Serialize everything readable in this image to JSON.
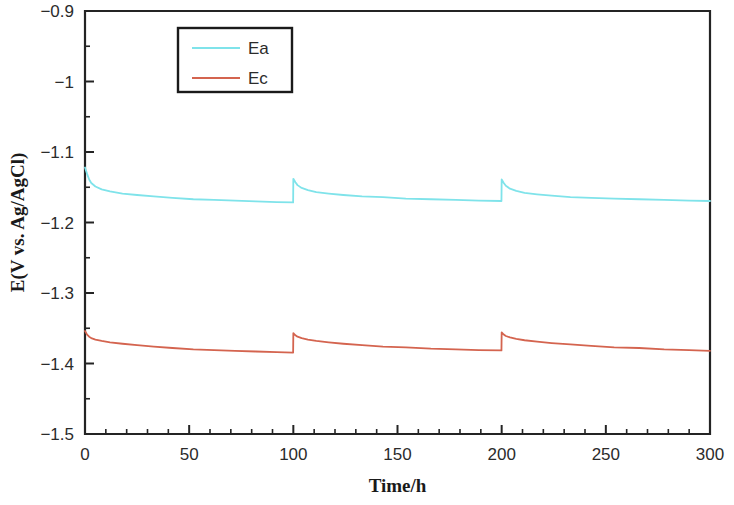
{
  "chart_data": {
    "type": "line",
    "title": "",
    "xlabel": "Time/h",
    "ylabel": "E(V vs. Ag/AgCl)",
    "xlim": [
      0,
      300
    ],
    "ylim": [
      -1.5,
      -0.9
    ],
    "grid": false,
    "legend_position": "top-center",
    "x_ticks": [
      0,
      50,
      100,
      150,
      200,
      250,
      300
    ],
    "x_tick_labels": [
      "0",
      "50",
      "100",
      "150",
      "200",
      "250",
      "300"
    ],
    "x_minor_step": 10,
    "y_ticks": [
      -1.5,
      -1.4,
      -1.3,
      -1.2,
      -1.1,
      -1.0,
      -0.9
    ],
    "y_tick_labels": [
      "−1.5",
      "−1.4",
      "−1.3",
      "−1.2",
      "−1.1",
      "−1",
      "−0.9"
    ],
    "y_minor_step": 0.05,
    "series": [
      {
        "name": "Ea",
        "color": "#7FE3EA",
        "points": [
          [
            0,
            -1.122
          ],
          [
            1,
            -1.131
          ],
          [
            2,
            -1.139
          ],
          [
            3,
            -1.144
          ],
          [
            5,
            -1.149
          ],
          [
            8,
            -1.153
          ],
          [
            12,
            -1.156
          ],
          [
            18,
            -1.159
          ],
          [
            25,
            -1.161
          ],
          [
            33,
            -1.163
          ],
          [
            42,
            -1.165
          ],
          [
            52,
            -1.167
          ],
          [
            62,
            -1.168
          ],
          [
            72,
            -1.169
          ],
          [
            82,
            -1.17
          ],
          [
            92,
            -1.171
          ],
          [
            99.9,
            -1.1715
          ],
          [
            100,
            -1.138
          ],
          [
            101,
            -1.143
          ],
          [
            102,
            -1.147
          ],
          [
            104,
            -1.151
          ],
          [
            107,
            -1.154
          ],
          [
            111,
            -1.157
          ],
          [
            117,
            -1.159
          ],
          [
            124,
            -1.161
          ],
          [
            133,
            -1.163
          ],
          [
            143,
            -1.164
          ],
          [
            154,
            -1.166
          ],
          [
            166,
            -1.167
          ],
          [
            178,
            -1.168
          ],
          [
            189,
            -1.169
          ],
          [
            199.9,
            -1.1695
          ],
          [
            200,
            -1.139
          ],
          [
            201,
            -1.144
          ],
          [
            202,
            -1.148
          ],
          [
            204,
            -1.152
          ],
          [
            207,
            -1.155
          ],
          [
            211,
            -1.158
          ],
          [
            217,
            -1.16
          ],
          [
            224,
            -1.162
          ],
          [
            233,
            -1.164
          ],
          [
            243,
            -1.165
          ],
          [
            254,
            -1.166
          ],
          [
            266,
            -1.167
          ],
          [
            278,
            -1.168
          ],
          [
            290,
            -1.169
          ],
          [
            300,
            -1.1695
          ]
        ]
      },
      {
        "name": "Ec",
        "color": "#D4644F",
        "points": [
          [
            0,
            -1.354
          ],
          [
            1,
            -1.359
          ],
          [
            2,
            -1.362
          ],
          [
            3,
            -1.364
          ],
          [
            5,
            -1.366
          ],
          [
            8,
            -1.368
          ],
          [
            12,
            -1.37
          ],
          [
            18,
            -1.372
          ],
          [
            25,
            -1.374
          ],
          [
            33,
            -1.376
          ],
          [
            42,
            -1.378
          ],
          [
            52,
            -1.38
          ],
          [
            62,
            -1.381
          ],
          [
            72,
            -1.382
          ],
          [
            82,
            -1.383
          ],
          [
            92,
            -1.384
          ],
          [
            99.9,
            -1.3845
          ],
          [
            100,
            -1.357
          ],
          [
            101,
            -1.36
          ],
          [
            102,
            -1.362
          ],
          [
            104,
            -1.364
          ],
          [
            107,
            -1.366
          ],
          [
            111,
            -1.368
          ],
          [
            117,
            -1.37
          ],
          [
            124,
            -1.372
          ],
          [
            133,
            -1.374
          ],
          [
            143,
            -1.376
          ],
          [
            154,
            -1.377
          ],
          [
            166,
            -1.379
          ],
          [
            178,
            -1.38
          ],
          [
            189,
            -1.381
          ],
          [
            199.9,
            -1.3815
          ],
          [
            200,
            -1.356
          ],
          [
            201,
            -1.359
          ],
          [
            202,
            -1.361
          ],
          [
            204,
            -1.363
          ],
          [
            207,
            -1.365
          ],
          [
            211,
            -1.367
          ],
          [
            217,
            -1.369
          ],
          [
            224,
            -1.371
          ],
          [
            233,
            -1.373
          ],
          [
            243,
            -1.375
          ],
          [
            254,
            -1.377
          ],
          [
            266,
            -1.378
          ],
          [
            278,
            -1.38
          ],
          [
            290,
            -1.381
          ],
          [
            300,
            -1.382
          ]
        ]
      }
    ],
    "legend": [
      {
        "label": "Ea",
        "color": "#7FE3EA"
      },
      {
        "label": "Ec",
        "color": "#D4644F"
      }
    ]
  }
}
